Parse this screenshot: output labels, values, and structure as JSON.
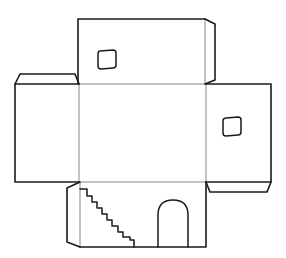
{
  "figure": {
    "type": "paper-box-net",
    "background_color": "#ffffff",
    "line_color": "#1a1a1a",
    "fold_line_color": "#555555",
    "top_marks": "' '"
  },
  "panels": [
    {
      "name": "top-wall",
      "features": [
        "square-window",
        "right-glue-tab"
      ]
    },
    {
      "name": "left-wall",
      "features": [
        "top-glue-tab"
      ]
    },
    {
      "name": "center-roof",
      "features": []
    },
    {
      "name": "right-wall",
      "features": [
        "square-window",
        "bottom-glue-tab"
      ]
    },
    {
      "name": "bottom-wall",
      "features": [
        "staircase",
        "arched-door",
        "left-glue-tab"
      ]
    }
  ]
}
